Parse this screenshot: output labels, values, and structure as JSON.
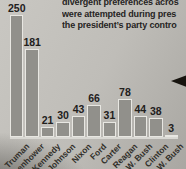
{
  "page_text": {
    "lines": [
      "divergent preferences acros",
      "were attempted during pres",
      "the president’s party contro"
    ]
  },
  "chart_data": {
    "type": "bar",
    "categories": [
      "Truman",
      "Eisenhower",
      "Kennedy",
      "Johnson",
      "Nixon",
      "Ford",
      "Carter",
      "Reagan",
      "G.H.W. Bush",
      "Clinton",
      "G.W. Bush"
    ],
    "values": [
      250,
      181,
      21,
      30,
      43,
      66,
      31,
      78,
      44,
      38,
      3
    ],
    "title": "",
    "xlabel": "",
    "ylabel": "",
    "ylim": [
      0,
      250
    ],
    "grid": false,
    "legend": false,
    "value_labels_shown": true,
    "x_tick_rotation_deg": 45,
    "bar_color": "#91908b",
    "bar_outline_color": "#e8e7e2",
    "value_label_color": "#22201c",
    "text_color": "#26241f"
  },
  "marker": {
    "icon": "left-arrowhead",
    "color": "#17140f"
  }
}
